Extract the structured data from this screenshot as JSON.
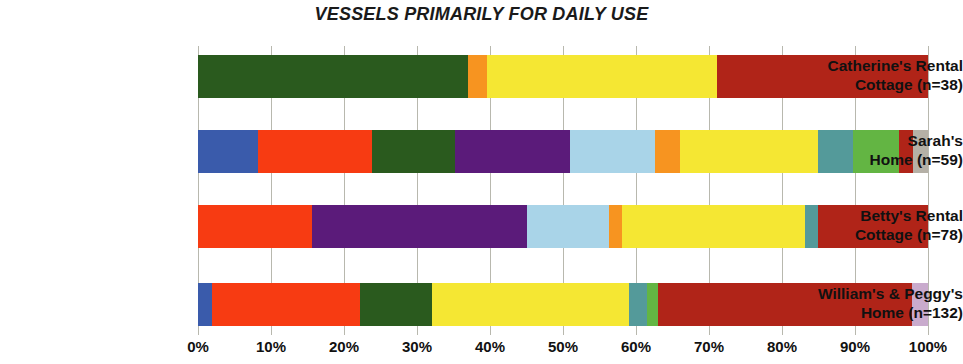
{
  "chart_data": {
    "type": "bar",
    "orientation": "horizontal",
    "stacked": true,
    "normalized": true,
    "title": "VESSELS PRIMARILY FOR DAILY USE",
    "xlabel": "",
    "ylabel": "",
    "xlim": [
      0,
      100
    ],
    "grid": true,
    "legend": "none",
    "xticks": [
      "0%",
      "10%",
      "20%",
      "30%",
      "40%",
      "50%",
      "60%",
      "70%",
      "80%",
      "90%",
      "100%"
    ],
    "xtick_values": [
      0,
      10,
      20,
      30,
      40,
      50,
      60,
      70,
      80,
      90,
      100
    ],
    "categories": [
      "Catherine's Rental Cottage (n=38)",
      "Sarah's Home (n=59)",
      "Betty's Rental Cottage (n=78)",
      "William's & Peggy's Home (n=132)"
    ],
    "category_lines": [
      [
        "Catherine's Rental",
        "Cottage (n=38)"
      ],
      [
        "Sarah's",
        "Home (n=59)"
      ],
      [
        "Betty's Rental",
        "Cottage (n=78)"
      ],
      [
        "William's & Peggy's",
        "Home (n=132)"
      ]
    ],
    "colors": {
      "dark_green": "#2a5a1e",
      "orange": "#f79420",
      "yellow": "#f5e733",
      "dark_red": "#b02418",
      "blue": "#3a5bab",
      "red": "#f73b12",
      "purple": "#5b1b7a",
      "light_blue": "#a9d4e8",
      "teal": "#549a9a",
      "green": "#63b543",
      "grey": "#b5b0a6",
      "lavender": "#c9abcd"
    },
    "bars": [
      {
        "category": "Catherine's Rental Cottage (n=38)",
        "segments": [
          {
            "color": "#2a5a1e",
            "name": "dark-green",
            "value": 37.0
          },
          {
            "color": "#f79420",
            "name": "orange",
            "value": 2.6
          },
          {
            "color": "#f5e733",
            "name": "yellow",
            "value": 31.5
          },
          {
            "color": "#b02418",
            "name": "dark-red",
            "value": 28.9
          }
        ]
      },
      {
        "category": "Sarah's Home (n=59)",
        "segments": [
          {
            "color": "#3a5bab",
            "name": "blue",
            "value": 8.2
          },
          {
            "color": "#f73b12",
            "name": "red",
            "value": 15.6
          },
          {
            "color": "#2a5a1e",
            "name": "dark-green",
            "value": 11.4
          },
          {
            "color": "#5b1b7a",
            "name": "purple",
            "value": 15.8
          },
          {
            "color": "#a9d4e8",
            "name": "light-blue",
            "value": 11.6
          },
          {
            "color": "#f79420",
            "name": "orange",
            "value": 3.4
          },
          {
            "color": "#f5e733",
            "name": "yellow",
            "value": 18.9
          },
          {
            "color": "#549a9a",
            "name": "teal",
            "value": 4.8
          },
          {
            "color": "#63b543",
            "name": "green",
            "value": 6.4
          },
          {
            "color": "#b02418",
            "name": "dark-red",
            "value": 1.8
          },
          {
            "color": "#b5b0a6",
            "name": "grey",
            "value": 2.1
          }
        ]
      },
      {
        "category": "Betty's Rental Cottage (n=78)",
        "segments": [
          {
            "color": "#f73b12",
            "name": "red",
            "value": 15.6
          },
          {
            "color": "#5b1b7a",
            "name": "purple",
            "value": 29.5
          },
          {
            "color": "#a9d4e8",
            "name": "light-blue",
            "value": 11.2
          },
          {
            "color": "#f79420",
            "name": "orange",
            "value": 1.8
          },
          {
            "color": "#f5e733",
            "name": "yellow",
            "value": 25.1
          },
          {
            "color": "#549a9a",
            "name": "teal",
            "value": 1.8
          },
          {
            "color": "#b02418",
            "name": "dark-red",
            "value": 15.0
          }
        ]
      },
      {
        "category": "William's & Peggy's Home (n=132)",
        "segments": [
          {
            "color": "#3a5bab",
            "name": "blue",
            "value": 1.9
          },
          {
            "color": "#f73b12",
            "name": "red",
            "value": 20.3
          },
          {
            "color": "#2a5a1e",
            "name": "dark-green",
            "value": 9.9
          },
          {
            "color": "#f5e733",
            "name": "yellow",
            "value": 26.9
          },
          {
            "color": "#549a9a",
            "name": "teal",
            "value": 2.5
          },
          {
            "color": "#63b543",
            "name": "green",
            "value": 1.5
          },
          {
            "color": "#b02418",
            "name": "dark-red",
            "value": 34.8
          },
          {
            "color": "#c9abcd",
            "name": "lavender",
            "value": 2.2
          }
        ]
      }
    ]
  }
}
